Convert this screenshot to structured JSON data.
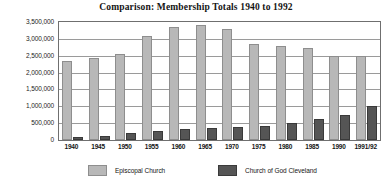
{
  "chart_data": {
    "type": "bar",
    "title": "Comparison: Membership Totals 1940 to 1992",
    "xlabel": "",
    "ylabel": "",
    "ylim": [
      0,
      3500000
    ],
    "ytick_step": 500000,
    "ytick_labels": [
      "3,500,000",
      "3,000,000",
      "2,500,000",
      "2,000,000",
      "1,500,000",
      "1,000,000",
      "500,000",
      "0"
    ],
    "ytick_values": [
      3500000,
      3000000,
      2500000,
      2000000,
      1500000,
      1000000,
      500000,
      0
    ],
    "grid": true,
    "legend_position": "bottom",
    "categories": [
      "1940",
      "1945",
      "1950",
      "1955",
      "1960",
      "1965",
      "1970",
      "1975",
      "1980",
      "1985",
      "1990",
      "1991/92"
    ],
    "series": [
      {
        "name": "Episcopal Church",
        "color": "#b8b8b8",
        "values": [
          2350000,
          2430000,
          2550000,
          3100000,
          3340000,
          3420000,
          3280000,
          2860000,
          2780000,
          2720000,
          2500000,
          2480000
        ]
      },
      {
        "name": "Church of God Cleveland",
        "color": "#555555",
        "values": [
          80000,
          130000,
          210000,
          280000,
          320000,
          350000,
          390000,
          420000,
          500000,
          620000,
          740000,
          1000000
        ]
      }
    ]
  },
  "legend": {
    "entries": [
      {
        "label": "Episcopal Church"
      },
      {
        "label": "Church of God Cleveland"
      }
    ]
  }
}
